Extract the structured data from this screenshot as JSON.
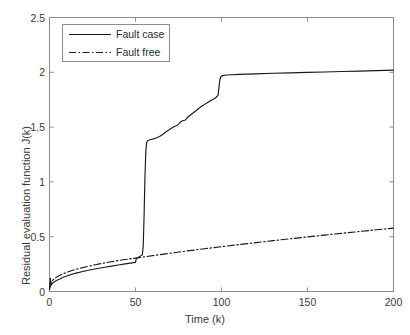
{
  "chart_data": {
    "type": "line",
    "title": "",
    "xlabel": "Time (k)",
    "ylabel": "Residual evaluation function J(k)",
    "xlim": [
      0,
      200
    ],
    "ylim": [
      0,
      2.5
    ],
    "xticks": [
      0,
      50,
      100,
      150,
      200
    ],
    "xtick_labels": [
      "0",
      "50",
      "100",
      "150",
      "200"
    ],
    "yticks": [
      0,
      0.5,
      1,
      1.5,
      2,
      2.5
    ],
    "ytick_labels": [
      "0",
      "0.5",
      "1",
      "1.5",
      "2",
      "2.5"
    ],
    "grid": false,
    "legend_position": "upper left",
    "series": [
      {
        "name": "Fault case",
        "style": "solid",
        "color": "#1a1a1a",
        "x": [
          0,
          0.5,
          1,
          1.5,
          2,
          3,
          4,
          6,
          8,
          10,
          13,
          16,
          20,
          24,
          28,
          32,
          36,
          40,
          44,
          47,
          50,
          50.5,
          51,
          51.5,
          52,
          53,
          54,
          54.5,
          55,
          55.5,
          56,
          56.5,
          57,
          58,
          59,
          60,
          62,
          64,
          66,
          68,
          70,
          72,
          74,
          75,
          76,
          77,
          78,
          79,
          80,
          82,
          84,
          86,
          88,
          90,
          92,
          94,
          96,
          97,
          98,
          98.5,
          99,
          99.5,
          100,
          101,
          103,
          106,
          110,
          120,
          130,
          140,
          150,
          160,
          170,
          180,
          190,
          200
        ],
        "y": [
          0.02,
          0.12,
          0.06,
          0.07,
          0.08,
          0.09,
          0.1,
          0.115,
          0.13,
          0.142,
          0.157,
          0.17,
          0.185,
          0.198,
          0.21,
          0.221,
          0.232,
          0.242,
          0.252,
          0.259,
          0.266,
          0.3,
          0.305,
          0.31,
          0.315,
          0.325,
          0.335,
          0.42,
          0.7,
          1.05,
          1.28,
          1.36,
          1.375,
          1.382,
          1.387,
          1.39,
          1.4,
          1.415,
          1.435,
          1.46,
          1.48,
          1.5,
          1.515,
          1.525,
          1.545,
          1.555,
          1.56,
          1.565,
          1.585,
          1.61,
          1.635,
          1.66,
          1.685,
          1.705,
          1.725,
          1.745,
          1.76,
          1.775,
          1.79,
          1.86,
          1.93,
          1.955,
          1.965,
          1.972,
          1.975,
          1.978,
          1.981,
          1.986,
          1.991,
          1.995,
          1.999,
          2.003,
          2.007,
          2.011,
          2.015,
          2.02
        ]
      },
      {
        "name": "Fault free",
        "style": "dashdot",
        "color": "#1a1a1a",
        "x": [
          0,
          1,
          2,
          4,
          6,
          8,
          10,
          14,
          18,
          22,
          26,
          30,
          35,
          40,
          45,
          50,
          55,
          60,
          70,
          80,
          90,
          100,
          110,
          120,
          130,
          140,
          150,
          160,
          170,
          180,
          190,
          200
        ],
        "y": [
          0.02,
          0.085,
          0.105,
          0.13,
          0.148,
          0.162,
          0.175,
          0.196,
          0.213,
          0.228,
          0.242,
          0.255,
          0.269,
          0.282,
          0.294,
          0.305,
          0.316,
          0.327,
          0.349,
          0.37,
          0.39,
          0.409,
          0.428,
          0.446,
          0.464,
          0.481,
          0.498,
          0.515,
          0.531,
          0.547,
          0.563,
          0.578
        ]
      }
    ]
  },
  "axes": {
    "box_color": "#8d8d8d",
    "tick_color": "#8d8d8d",
    "background": "#ffffff"
  }
}
